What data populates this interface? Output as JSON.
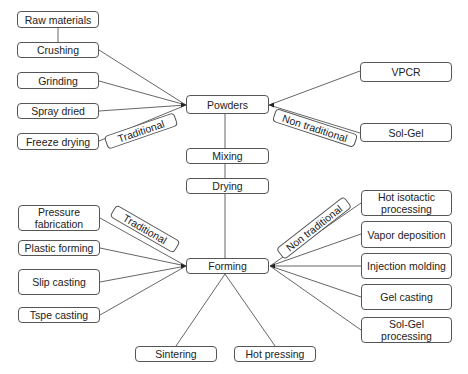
{
  "diagram": {
    "type": "flowchart",
    "colors": {
      "line": "#555555",
      "border": "#555555",
      "text": "#222222",
      "background": "#ffffff"
    },
    "nodes": {
      "raw_materials": "Raw materials",
      "crushing": "Crushing",
      "grinding": "Grinding",
      "spray_dried": "Spray dried",
      "freeze_drying": "Freeze drying",
      "powders": "Powders",
      "vpcr": "VPCR",
      "sol_gel": "Sol-Gel",
      "mixing": "Mixing",
      "drying": "Drying",
      "pressure_fabrication": "Pressure\nfabrication",
      "plastic_forming": "Plastic forming",
      "slip_casting": "Slip casting",
      "tspe_casting": "Tspe casting",
      "forming": "Forming",
      "hot_isotactic": "Hot isotactic\nprocessing",
      "vapor_deposition": "Vapor deposition",
      "injection_molding": "Injection molding",
      "gel_casting": "Gel casting",
      "sol_gel_processing": "Sol-Gel\nprocessing",
      "sintering": "Sintering",
      "hot_pressing": "Hot pressing"
    },
    "labels": {
      "powders_traditional": "Traditional",
      "powders_non_traditional": "Non traditional",
      "forming_traditional": "Traditional",
      "forming_non_traditional": "Non traditional"
    },
    "edges": [
      [
        "Raw materials",
        "Crushing"
      ],
      [
        "Crushing",
        "Powders"
      ],
      [
        "Grinding",
        "Powders"
      ],
      [
        "Spray dried",
        "Powders"
      ],
      [
        "Freeze drying",
        "Powders"
      ],
      [
        "Powders",
        "VPCR"
      ],
      [
        "Powders",
        "Sol-Gel"
      ],
      [
        "Powders",
        "Mixing"
      ],
      [
        "Mixing",
        "Drying"
      ],
      [
        "Drying",
        "Forming"
      ],
      [
        "Pressure fabrication",
        "Forming"
      ],
      [
        "Plastic forming",
        "Forming"
      ],
      [
        "Slip casting",
        "Forming"
      ],
      [
        "Tspe casting",
        "Forming"
      ],
      [
        "Forming",
        "Hot isotactic processing"
      ],
      [
        "Forming",
        "Vapor deposition"
      ],
      [
        "Forming",
        "Injection molding"
      ],
      [
        "Forming",
        "Gel casting"
      ],
      [
        "Forming",
        "Sol-Gel processing"
      ],
      [
        "Forming",
        "Sintering"
      ],
      [
        "Forming",
        "Hot pressing"
      ]
    ]
  }
}
